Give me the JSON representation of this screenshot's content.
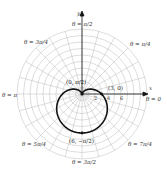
{
  "chart_data": {
    "type": "polar",
    "title": "",
    "equation_implied": "r = 3 - 3 sin(theta)",
    "axis_labels": {
      "x": "x",
      "y": "y"
    },
    "radial_ticks": [
      "2",
      "4",
      "6"
    ],
    "radial_grid_max": 10,
    "angle_labels": [
      {
        "text": "θ = π/2",
        "angle_deg": 90
      },
      {
        "text": "θ = π/4",
        "angle_deg": 45
      },
      {
        "text": "θ = 0",
        "angle_deg": 0
      },
      {
        "text": "θ = 7π/4",
        "angle_deg": -45
      },
      {
        "text": "θ = 3π/2",
        "angle_deg": -90
      },
      {
        "text": "θ = 5π/4",
        "angle_deg": -135
      },
      {
        "text": "θ = π",
        "angle_deg": 180
      },
      {
        "text": "θ = 3π/4",
        "angle_deg": 135
      }
    ],
    "labeled_points": [
      {
        "label": "(3, 0)",
        "r": 3,
        "theta": "0"
      },
      {
        "label": "(0, π/2)",
        "r": 0,
        "theta": "π/2"
      },
      {
        "label": "(6, −π/2)",
        "r": 6,
        "theta": "−π/2"
      }
    ]
  },
  "labels": {
    "y_axis": "y",
    "x_axis": "x",
    "theta_pi_over_2": "θ = π/2",
    "theta_pi_over_4": "θ = π/4",
    "theta_0": "θ = 0",
    "theta_7pi_over_4": "θ = 7π/4",
    "theta_3pi_over_2": "θ = 3π/2",
    "theta_5pi_over_4": "θ = 5π/4",
    "theta_pi": "θ = π",
    "theta_3pi_over_4": "θ = 3π/4",
    "point_3_0": "(3, 0)",
    "point_0_pi2": "(0, π/2)",
    "point_6_negpi2": "(6, −π/2)",
    "tick_2": "2",
    "tick_4": "4",
    "tick_6": "6"
  }
}
